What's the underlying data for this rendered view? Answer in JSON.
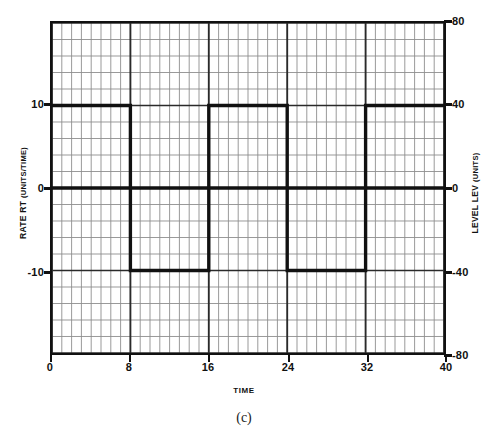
{
  "figure": {
    "caption": "(c)"
  },
  "axes": {
    "x": {
      "title": "TIME",
      "ticks": [
        "0",
        "8",
        "16",
        "24",
        "32",
        "40"
      ],
      "tick_values": [
        0,
        8,
        16,
        24,
        32,
        40
      ],
      "min": 0,
      "max": 40
    },
    "y_left": {
      "title_main": "RATE RT",
      "title_units": "(UNITS/TIME)",
      "ticks": [
        "10",
        "0",
        "-10"
      ],
      "tick_values": [
        10,
        0,
        -10
      ],
      "min": -20,
      "max": 20
    },
    "y_right": {
      "title_main": "LEVEL LEV",
      "title_units": "(UNITS)",
      "ticks": [
        "80",
        "40",
        "0",
        "-40",
        "-80"
      ],
      "tick_values": [
        80,
        40,
        0,
        -40,
        -80
      ],
      "min": -80,
      "max": 80
    }
  },
  "style": {
    "line_color": "#111111",
    "grid_minor_color": "#8d8d8d",
    "grid_major_color": "#2a2a2a",
    "background": "#ffffff"
  },
  "chart_data": {
    "type": "line",
    "title": "",
    "subtitle": "",
    "xlabel": "TIME",
    "ylabel": "RATE RT (UNITS/TIME)",
    "ylabel_secondary": "LEVEL LEV (UNITS)",
    "xlim": [
      0,
      40
    ],
    "ylim": [
      -20,
      20
    ],
    "ylim_secondary": [
      -80,
      80
    ],
    "grid": true,
    "grid_minor_x_step": 1,
    "grid_minor_y_step": 2,
    "grid_major_x_step": 8,
    "grid_major_y_step": 10,
    "legend": "none",
    "series": [
      {
        "name": "RATE RT",
        "axis": "left",
        "shape": "square-wave",
        "points": [
          {
            "x": 0,
            "y": 10
          },
          {
            "x": 8,
            "y": 10
          },
          {
            "x": 8,
            "y": -10
          },
          {
            "x": 16,
            "y": -10
          },
          {
            "x": 16,
            "y": 10
          },
          {
            "x": 24,
            "y": 10
          },
          {
            "x": 24,
            "y": -10
          },
          {
            "x": 32,
            "y": -10
          },
          {
            "x": 32,
            "y": 10
          },
          {
            "x": 40,
            "y": 10
          }
        ]
      },
      {
        "name": "zero-reference",
        "axis": "left",
        "shape": "horizontal-line",
        "points": [
          {
            "x": 0,
            "y": 0
          },
          {
            "x": 40,
            "y": 0
          }
        ]
      }
    ],
    "annotations": [
      "(c)"
    ]
  }
}
